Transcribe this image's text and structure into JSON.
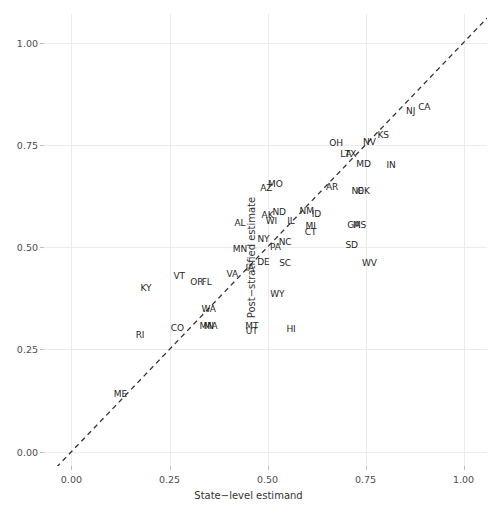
{
  "chart_data": {
    "type": "scatter",
    "title": "",
    "subtitle": "",
    "xlabel": "State−level estimand",
    "ylabel": "Post−stratified estimate",
    "xlim": [
      -0.07,
      1.06
    ],
    "ylim": [
      -0.035,
      1.07
    ],
    "xticks": [
      0.0,
      0.25,
      0.5,
      0.75,
      1.0
    ],
    "xticklabels": [
      "0.00",
      "0.25",
      "0.50",
      "0.75",
      "1.00"
    ],
    "yticks": [
      0.0,
      0.25,
      0.5,
      0.75,
      1.0
    ],
    "yticklabels": [
      "0.00",
      "0.25",
      "0.50",
      "0.75",
      "1.00"
    ],
    "grid": true,
    "legend": null,
    "legend_position": "none",
    "marker": "text-label",
    "point_label_field": "label",
    "annotations": [
      {
        "type": "line",
        "name": "identity-reference-line",
        "style": "dashed",
        "color": "#333333",
        "x": [
          -0.07,
          1.06
        ],
        "y": [
          -0.07,
          1.06
        ]
      }
    ],
    "points": [
      {
        "label": "ME",
        "x": 0.125,
        "y": 0.14
      },
      {
        "label": "RI",
        "x": 0.175,
        "y": 0.285
      },
      {
        "label": "CO",
        "x": 0.27,
        "y": 0.303
      },
      {
        "label": "KY",
        "x": 0.19,
        "y": 0.4
      },
      {
        "label": "WA",
        "x": 0.35,
        "y": 0.35
      },
      {
        "label": "MN",
        "x": 0.345,
        "y": 0.307
      },
      {
        "label": "MA",
        "x": 0.355,
        "y": 0.307
      },
      {
        "label": "VT",
        "x": 0.275,
        "y": 0.43
      },
      {
        "label": "OR",
        "x": 0.32,
        "y": 0.415
      },
      {
        "label": "FL",
        "x": 0.345,
        "y": 0.415
      },
      {
        "label": "VA",
        "x": 0.41,
        "y": 0.435
      },
      {
        "label": "IA",
        "x": 0.455,
        "y": 0.448
      },
      {
        "label": "MT",
        "x": 0.46,
        "y": 0.307
      },
      {
        "label": "UT",
        "x": 0.46,
        "y": 0.295
      },
      {
        "label": "HI",
        "x": 0.56,
        "y": 0.3
      },
      {
        "label": "WY",
        "x": 0.525,
        "y": 0.385
      },
      {
        "label": "MN",
        "x": 0.43,
        "y": 0.495
      },
      {
        "label": "NY",
        "x": 0.49,
        "y": 0.52
      },
      {
        "label": "DE",
        "x": 0.49,
        "y": 0.463
      },
      {
        "label": "PA",
        "x": 0.52,
        "y": 0.5
      },
      {
        "label": "NC",
        "x": 0.545,
        "y": 0.513
      },
      {
        "label": "SC",
        "x": 0.545,
        "y": 0.462
      },
      {
        "label": "AL",
        "x": 0.43,
        "y": 0.558
      },
      {
        "label": "AK",
        "x": 0.5,
        "y": 0.578
      },
      {
        "label": "WI",
        "x": 0.51,
        "y": 0.565
      },
      {
        "label": "ND",
        "x": 0.53,
        "y": 0.585
      },
      {
        "label": "IL",
        "x": 0.56,
        "y": 0.565
      },
      {
        "label": "NM",
        "x": 0.6,
        "y": 0.588
      },
      {
        "label": "ID",
        "x": 0.625,
        "y": 0.58
      },
      {
        "label": "MI",
        "x": 0.61,
        "y": 0.552
      },
      {
        "label": "CT",
        "x": 0.61,
        "y": 0.538
      },
      {
        "label": "AZ",
        "x": 0.497,
        "y": 0.645
      },
      {
        "label": "MO",
        "x": 0.52,
        "y": 0.655
      },
      {
        "label": "AR",
        "x": 0.665,
        "y": 0.648
      },
      {
        "label": "GA",
        "x": 0.72,
        "y": 0.555
      },
      {
        "label": "MS",
        "x": 0.735,
        "y": 0.555
      },
      {
        "label": "SD",
        "x": 0.715,
        "y": 0.505
      },
      {
        "label": "WV",
        "x": 0.76,
        "y": 0.462
      },
      {
        "label": "NE",
        "x": 0.73,
        "y": 0.638
      },
      {
        "label": "OK",
        "x": 0.745,
        "y": 0.638
      },
      {
        "label": "OH",
        "x": 0.675,
        "y": 0.755
      },
      {
        "label": "LA",
        "x": 0.7,
        "y": 0.727
      },
      {
        "label": "TX",
        "x": 0.712,
        "y": 0.727
      },
      {
        "label": "NV",
        "x": 0.76,
        "y": 0.757
      },
      {
        "label": "KS",
        "x": 0.795,
        "y": 0.775
      },
      {
        "label": "MD",
        "x": 0.745,
        "y": 0.703
      },
      {
        "label": "IN",
        "x": 0.815,
        "y": 0.7
      },
      {
        "label": "NJ",
        "x": 0.865,
        "y": 0.833
      },
      {
        "label": "CA",
        "x": 0.9,
        "y": 0.843
      }
    ]
  }
}
